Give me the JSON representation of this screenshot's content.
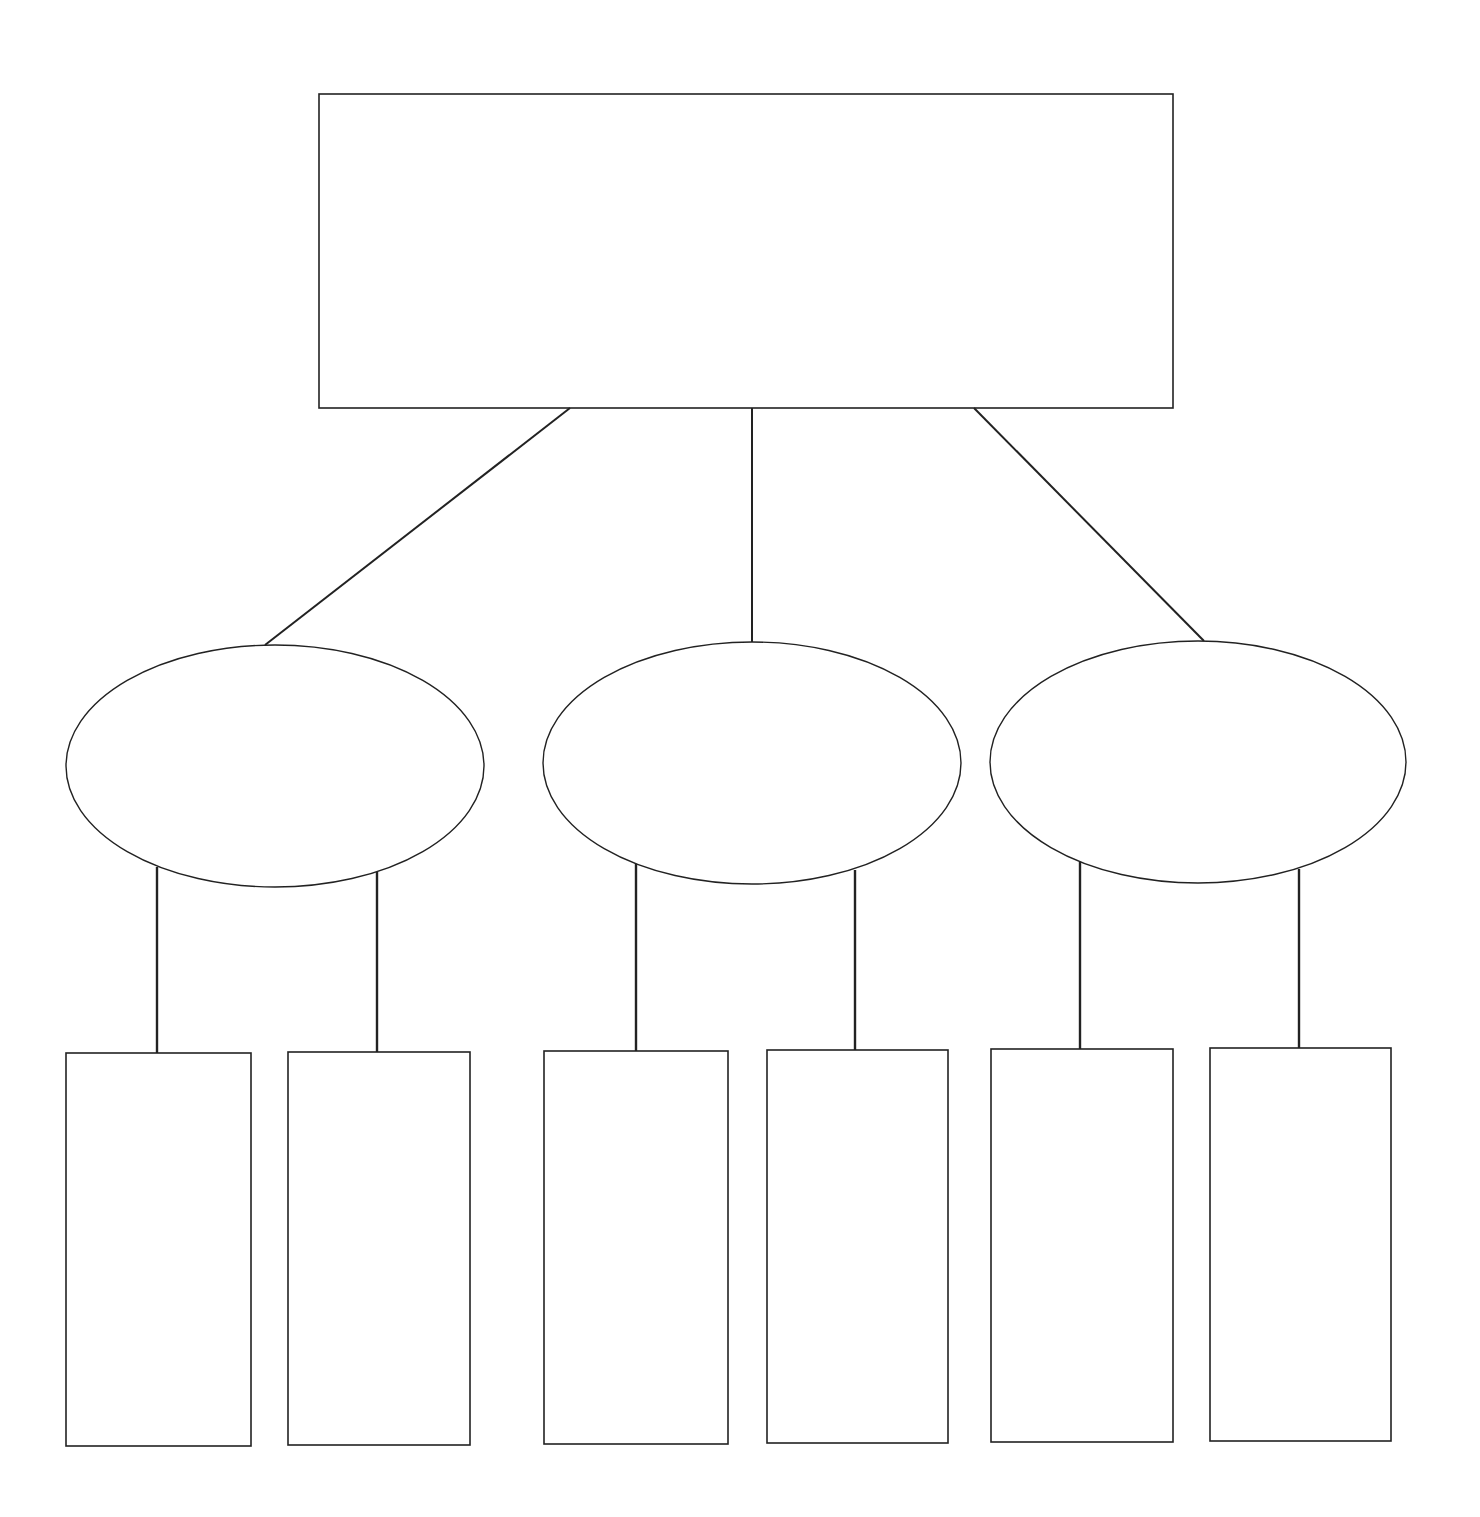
{
  "diagram": {
    "type": "hierarchy-graphic-organizer",
    "stroke_color": "#222222",
    "background": "#ffffff",
    "root": {
      "label": "",
      "shape": "rectangle",
      "box": {
        "x": 319,
        "y": 94,
        "w": 854,
        "h": 314
      }
    },
    "branches": [
      {
        "label": "",
        "shape": "ellipse",
        "ellipse": {
          "cx": 275,
          "cy": 766,
          "rx": 209,
          "ry": 121
        },
        "connector_from_root": {
          "x1": 570,
          "y1": 408,
          "x2": 265,
          "y2": 645
        },
        "leaves": [
          {
            "label": "",
            "box": {
              "x": 66,
              "y": 1053,
              "w": 185,
              "h": 393
            },
            "connector": {
              "x1": 157,
              "y1": 867,
              "x2": 157,
              "y2": 1053
            }
          },
          {
            "label": "",
            "box": {
              "x": 288,
              "y": 1052,
              "w": 182,
              "h": 393
            },
            "connector": {
              "x1": 377,
              "y1": 872,
              "x2": 377,
              "y2": 1052
            }
          }
        ]
      },
      {
        "label": "",
        "shape": "ellipse",
        "ellipse": {
          "cx": 752,
          "cy": 763,
          "rx": 209,
          "ry": 121
        },
        "connector_from_root": {
          "x1": 752,
          "y1": 408,
          "x2": 752,
          "y2": 642
        },
        "leaves": [
          {
            "label": "",
            "box": {
              "x": 544,
              "y": 1051,
              "w": 184,
              "h": 393
            },
            "connector": {
              "x1": 636,
              "y1": 863,
              "x2": 636,
              "y2": 1051
            }
          },
          {
            "label": "",
            "box": {
              "x": 767,
              "y": 1050,
              "w": 181,
              "h": 393
            },
            "connector": {
              "x1": 855,
              "y1": 870,
              "x2": 855,
              "y2": 1050
            }
          }
        ]
      },
      {
        "label": "",
        "shape": "ellipse",
        "ellipse": {
          "cx": 1198,
          "cy": 762,
          "rx": 208,
          "ry": 121
        },
        "connector_from_root": {
          "x1": 974,
          "y1": 408,
          "x2": 1204,
          "y2": 641
        },
        "leaves": [
          {
            "label": "",
            "box": {
              "x": 991,
              "y": 1049,
              "w": 182,
              "h": 393
            },
            "connector": {
              "x1": 1080,
              "y1": 862,
              "x2": 1080,
              "y2": 1049
            }
          },
          {
            "label": "",
            "box": {
              "x": 1210,
              "y": 1048,
              "w": 181,
              "h": 393
            },
            "connector": {
              "x1": 1299,
              "y1": 869,
              "x2": 1299,
              "y2": 1048
            }
          }
        ]
      }
    ]
  }
}
